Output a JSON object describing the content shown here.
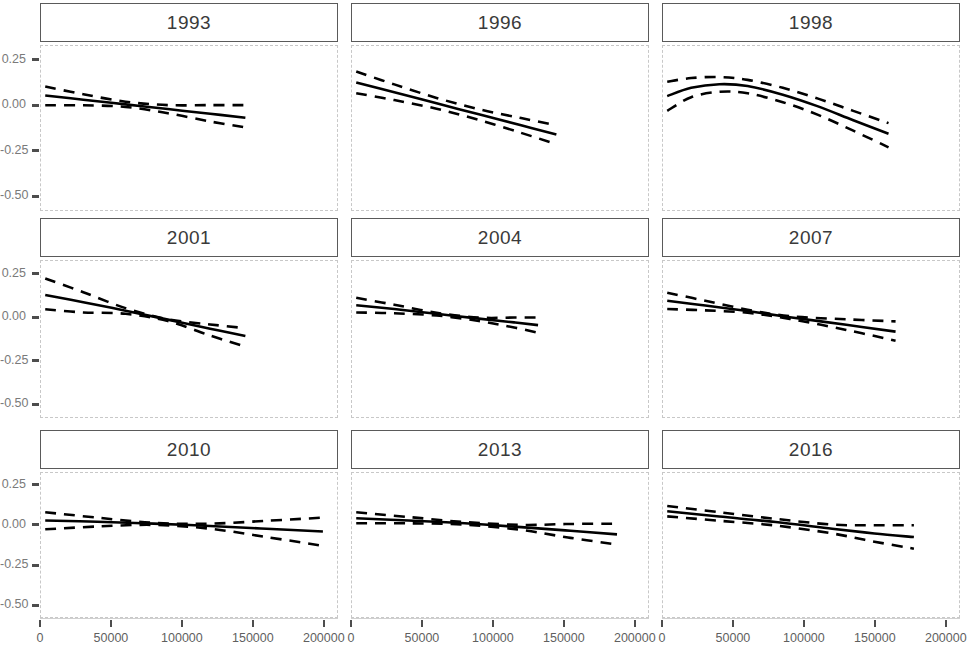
{
  "chart_data": {
    "type": "line",
    "title": "",
    "subtitle": "",
    "xlabel": "",
    "ylabel": "",
    "layout": {
      "rows": 3,
      "cols": 3,
      "shared_x": true,
      "shared_y": true,
      "grid": false,
      "legend": false
    },
    "xlim": [
      0,
      210000
    ],
    "ylim": [
      -0.58,
      0.33
    ],
    "x_ticks": [
      0,
      50000,
      100000,
      150000,
      200000
    ],
    "x_tick_labels": [
      "0",
      "50000",
      "100000",
      "150000",
      "200000"
    ],
    "y_ticks": [
      0.25,
      0.0,
      -0.25,
      -0.5
    ],
    "y_tick_labels": [
      "0.25",
      "0.00",
      "-0.25",
      "-0.50"
    ],
    "series_styles": {
      "fit": {
        "name": "fitted smooth",
        "style": "solid",
        "color": "#000000",
        "width": 2.6
      },
      "ci": {
        "name": "confidence band",
        "style": "dashed",
        "color": "#000000",
        "width": 2.6
      }
    },
    "panels": [
      {
        "label": "1993",
        "row": 0,
        "col": 0,
        "x": [
          3000,
          30000,
          60000,
          90000,
          120000,
          145000
        ],
        "fit": [
          0.055,
          0.032,
          0.006,
          -0.02,
          -0.046,
          -0.068
        ],
        "ci_upper": [
          0.105,
          0.062,
          0.021,
          0.002,
          0.002,
          0.002
        ],
        "ci_lower": [
          0.001,
          0.001,
          -0.008,
          -0.043,
          -0.089,
          -0.122
        ]
      },
      {
        "label": "1996",
        "row": 0,
        "col": 1,
        "x": [
          3000,
          30000,
          60000,
          90000,
          120000,
          145000
        ],
        "fit": [
          0.128,
          0.073,
          0.012,
          -0.049,
          -0.11,
          -0.161
        ],
        "ci_upper": [
          0.188,
          0.117,
          0.042,
          -0.021,
          -0.07,
          -0.11
        ],
        "ci_lower": [
          0.068,
          0.03,
          -0.018,
          -0.08,
          -0.152,
          -0.215
        ]
      },
      {
        "label": "1998",
        "row": 0,
        "col": 2,
        "x": [
          3000,
          20000,
          40000,
          60000,
          85000,
          110000,
          135000,
          160000
        ],
        "fit": [
          0.052,
          0.098,
          0.118,
          0.108,
          0.06,
          -0.005,
          -0.082,
          -0.157
        ],
        "ci_upper": [
          0.132,
          0.152,
          0.158,
          0.142,
          0.098,
          0.038,
          -0.03,
          -0.098
        ],
        "ci_lower": [
          -0.03,
          0.046,
          0.076,
          0.068,
          0.018,
          -0.052,
          -0.14,
          -0.232
        ]
      },
      {
        "label": "2001",
        "row": 1,
        "col": 0,
        "x": [
          3000,
          30000,
          60000,
          90000,
          120000,
          145000
        ],
        "fit": [
          0.132,
          0.09,
          0.04,
          -0.012,
          -0.065,
          -0.107
        ],
        "ci_upper": [
          0.228,
          0.148,
          0.055,
          -0.01,
          -0.04,
          -0.062
        ],
        "ci_lower": [
          0.048,
          0.03,
          0.022,
          -0.02,
          -0.105,
          -0.17
        ]
      },
      {
        "label": "2004",
        "row": 1,
        "col": 1,
        "x": [
          3000,
          30000,
          60000,
          90000,
          115000,
          132000
        ],
        "fit": [
          0.072,
          0.05,
          0.022,
          -0.006,
          -0.028,
          -0.044
        ],
        "ci_upper": [
          0.115,
          0.075,
          0.028,
          0.0,
          0.0,
          0.0
        ],
        "ci_lower": [
          0.03,
          0.025,
          0.012,
          -0.02,
          -0.058,
          -0.088
        ]
      },
      {
        "label": "2007",
        "row": 1,
        "col": 2,
        "x": [
          3000,
          30000,
          60000,
          90000,
          130000,
          165000
        ],
        "fit": [
          0.098,
          0.07,
          0.038,
          0.002,
          -0.042,
          -0.082
        ],
        "ci_upper": [
          0.145,
          0.098,
          0.046,
          0.008,
          -0.01,
          -0.022
        ],
        "ci_lower": [
          0.05,
          0.042,
          0.028,
          -0.008,
          -0.072,
          -0.135
        ]
      },
      {
        "label": "2010",
        "row": 2,
        "col": 0,
        "x": [
          3000,
          40000,
          80000,
          120000,
          160000,
          200000
        ],
        "fit": [
          0.03,
          0.022,
          0.01,
          -0.005,
          -0.022,
          -0.04
        ],
        "ci_upper": [
          0.082,
          0.048,
          0.015,
          0.01,
          0.028,
          0.048
        ],
        "ci_lower": [
          -0.026,
          -0.008,
          0.002,
          -0.022,
          -0.075,
          -0.13
        ]
      },
      {
        "label": "2013",
        "row": 2,
        "col": 1,
        "x": [
          3000,
          40000,
          80000,
          120000,
          155000,
          188000
        ],
        "fit": [
          0.044,
          0.03,
          0.012,
          -0.012,
          -0.035,
          -0.058
        ],
        "ci_upper": [
          0.082,
          0.052,
          0.02,
          0.002,
          0.008,
          0.01
        ],
        "ci_lower": [
          0.012,
          0.012,
          0.004,
          -0.03,
          -0.08,
          -0.122
        ]
      },
      {
        "label": "2016",
        "row": 2,
        "col": 2,
        "x": [
          3000,
          40000,
          80000,
          120000,
          150000,
          178000
        ],
        "fit": [
          0.088,
          0.055,
          0.02,
          -0.022,
          -0.052,
          -0.075
        ],
        "ci_upper": [
          0.122,
          0.082,
          0.04,
          0.004,
          0.0,
          0.0
        ],
        "ci_lower": [
          0.056,
          0.028,
          -0.002,
          -0.052,
          -0.104,
          -0.148
        ]
      }
    ]
  }
}
